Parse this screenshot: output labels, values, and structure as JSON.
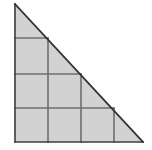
{
  "figure": {
    "name": "right-triangle-with-inscribed-square-staircase",
    "canvas": {
      "width": 152,
      "height": 150,
      "background": "#ffffff"
    },
    "colors": {
      "square_fill": "#d2d2d2",
      "triangle_fill": "#d2d2d2",
      "outline_stroke": "#3c3c3c",
      "grid_stroke": "#6e6e6e",
      "hypotenuse_stroke": "#333333"
    },
    "strokes": {
      "outline_width": 1.6,
      "grid_width": 1.6,
      "hypotenuse_width": 1.8
    },
    "triangle": {
      "type": "right-triangle",
      "apex": {
        "x": 15,
        "y": 4
      },
      "bottom_left": {
        "x": 15,
        "y": 142
      },
      "bottom_right": {
        "x": 143,
        "y": 142
      },
      "points": "15,4 15,142 143,142",
      "leg_vertical_length": 138,
      "leg_horizontal_length": 128
    },
    "grid": {
      "cell_size": 33,
      "x_lines": [
        15,
        48,
        81,
        114
      ],
      "y_lines": [
        38,
        74,
        108,
        142
      ],
      "rows": [
        {
          "index": 1,
          "label": "top-row",
          "squares": 1,
          "y_top": 38,
          "y_bottom": 74
        },
        {
          "index": 2,
          "label": "middle-row",
          "squares": 2,
          "y_top": 74,
          "y_bottom": 108
        },
        {
          "index": 3,
          "label": "bottom-row",
          "squares": 3,
          "y_top": 108,
          "y_bottom": 142
        }
      ]
    },
    "squares": [
      {
        "id": "square-r1-c1",
        "row": 1,
        "col": 1,
        "x": 15,
        "y": 38,
        "w": 33,
        "h": 36
      },
      {
        "id": "square-r2-c1",
        "row": 2,
        "col": 1,
        "x": 15,
        "y": 74,
        "w": 33,
        "h": 34
      },
      {
        "id": "square-r2-c2",
        "row": 2,
        "col": 2,
        "x": 48,
        "y": 74,
        "w": 33,
        "h": 34
      },
      {
        "id": "square-r3-c1",
        "row": 3,
        "col": 1,
        "x": 15,
        "y": 108,
        "w": 33,
        "h": 34
      },
      {
        "id": "square-r3-c2",
        "row": 3,
        "col": 2,
        "x": 48,
        "y": 108,
        "w": 33,
        "h": 34
      },
      {
        "id": "square-r3-c3",
        "row": 3,
        "col": 3,
        "x": 81,
        "y": 108,
        "w": 33,
        "h": 34
      }
    ],
    "grid_segments": [
      {
        "id": "h-line-top",
        "x1": 15,
        "y1": 38,
        "x2": 48,
        "y2": 38
      },
      {
        "id": "h-line-middle",
        "x1": 15,
        "y1": 74,
        "x2": 81,
        "y2": 74
      },
      {
        "id": "h-line-lower",
        "x1": 15,
        "y1": 108,
        "x2": 114,
        "y2": 108
      },
      {
        "id": "v-line-1",
        "x1": 48,
        "y1": 38,
        "x2": 48,
        "y2": 142
      },
      {
        "id": "v-line-2",
        "x1": 81,
        "y1": 74,
        "x2": 81,
        "y2": 142
      },
      {
        "id": "v-line-3",
        "x1": 114,
        "y1": 108,
        "x2": 114,
        "y2": 142
      }
    ],
    "labels": [],
    "total_squares": 6
  }
}
